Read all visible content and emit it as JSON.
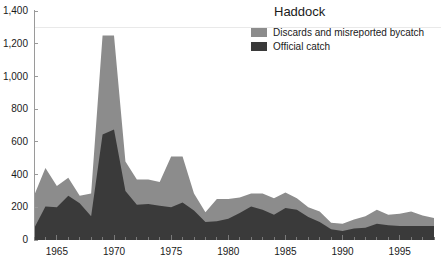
{
  "chart_data": {
    "type": "area",
    "title": "Haddock",
    "xlabel": "",
    "ylabel": "",
    "xlim": [
      1963,
      1998
    ],
    "ylim": [
      0,
      1400
    ],
    "xticks": [
      1965,
      1970,
      1975,
      1980,
      1985,
      1990,
      1995
    ],
    "xtick_labels": [
      "1965",
      "1970",
      "1975",
      "1980",
      "1985",
      "1990",
      "1995"
    ],
    "yticks": [
      0,
      200,
      400,
      600,
      800,
      1000,
      1200,
      1400
    ],
    "ytick_labels": [
      "0",
      "200",
      "400",
      "600",
      "800",
      "1,000",
      "1,200",
      "1,400"
    ],
    "grid": false,
    "legend_position": "top-right",
    "stacked": true,
    "x": [
      1963,
      1964,
      1965,
      1966,
      1967,
      1968,
      1969,
      1970,
      1971,
      1972,
      1973,
      1974,
      1975,
      1976,
      1977,
      1978,
      1979,
      1980,
      1981,
      1982,
      1983,
      1984,
      1985,
      1986,
      1987,
      1988,
      1989,
      1990,
      1991,
      1992,
      1993,
      1994,
      1995,
      1996,
      1997,
      1998
    ],
    "series": [
      {
        "name": "Official catch",
        "color": "#3a3a3a",
        "values": [
          70,
          205,
          200,
          270,
          225,
          145,
          645,
          675,
          300,
          215,
          220,
          210,
          200,
          230,
          180,
          110,
          115,
          130,
          165,
          205,
          185,
          155,
          195,
          185,
          140,
          110,
          65,
          55,
          70,
          75,
          100,
          90,
          85,
          85,
          85,
          85
        ]
      },
      {
        "name": "Discards and misreported bycatch",
        "color": "#8c8c8c",
        "values": [
          200,
          235,
          130,
          110,
          45,
          140,
          605,
          575,
          180,
          155,
          150,
          145,
          310,
          280,
          105,
          60,
          135,
          120,
          95,
          80,
          100,
          100,
          95,
          70,
          60,
          65,
          40,
          45,
          55,
          70,
          85,
          65,
          75,
          90,
          65,
          50
        ]
      }
    ],
    "totals": [
      270,
      440,
      330,
      380,
      270,
      285,
      1250,
      1250,
      480,
      370,
      370,
      355,
      510,
      510,
      285,
      170,
      250,
      250,
      260,
      285,
      285,
      255,
      290,
      255,
      200,
      175,
      105,
      100,
      125,
      145,
      185,
      155,
      160,
      175,
      150,
      135
    ]
  },
  "legend": {
    "title": "Haddock",
    "entries": [
      {
        "label": "Discards and misreported bycatch",
        "color": "#8c8c8c"
      },
      {
        "label": "Official catch",
        "color": "#3a3a3a"
      }
    ]
  },
  "colors": {
    "discards": "#8c8c8c",
    "official": "#3a3a3a",
    "axis": "#9a9a9a",
    "text": "#1a1a1a",
    "background": "#ffffff",
    "gridline": "#e9e9e9"
  }
}
